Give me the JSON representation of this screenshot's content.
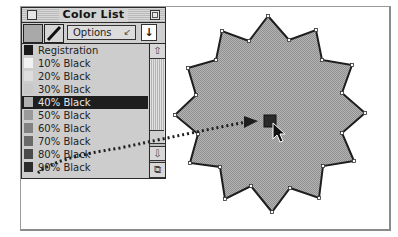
{
  "palette": {
    "title": "Color List",
    "options_label": "Options",
    "options_chevron": "↙",
    "sort_icon": "↓",
    "fill_color": "#a9a9a9",
    "selected_index": 4,
    "items": [
      {
        "label": "Registration",
        "color": "#1a1a1a"
      },
      {
        "label": "10% Black",
        "color": "#f2f2f2"
      },
      {
        "label": "20% Black",
        "color": "#dedede"
      },
      {
        "label": "30% Black",
        "color": "#c8c8c8"
      },
      {
        "label": "40% Black",
        "color": "#b0b0b0"
      },
      {
        "label": "50% Black",
        "color": "#9a9a9a"
      },
      {
        "label": "60% Black",
        "color": "#828282"
      },
      {
        "label": "70% Black",
        "color": "#6a6a6a"
      },
      {
        "label": "80% Black",
        "color": "#4a4a4a"
      },
      {
        "label": "90% Black",
        "color": "#2c2c2c"
      }
    ],
    "scroll": {
      "up_icon": "⇧",
      "down_icon": "⇩",
      "grow_icon": "⧉"
    }
  },
  "artwork": {
    "shape": "12-point star",
    "fill": "#a4a4a4",
    "stroke": "#2a2a2a",
    "drag_swatch_color": "#2a2a2a"
  }
}
